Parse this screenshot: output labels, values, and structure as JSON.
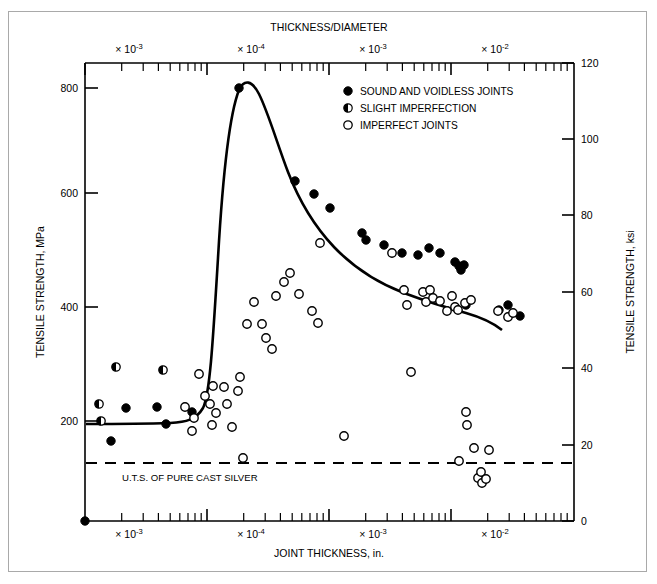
{
  "figure": {
    "background": "#ffffff",
    "frame_color": "#a9a9a9",
    "ink": "#000000"
  },
  "chart_data": {
    "type": "scatter",
    "title": "THICKNESS/DIAMETER",
    "xlabel": "JOINT THICKNESS, in.",
    "ylabel": "TENSILE STRENGTH, MPa",
    "y2label": "TENSILE STRENGTH, ksi",
    "grid": false,
    "legend_position": "top-right",
    "xscale": "log",
    "xlim": [
      1.0,
      10000.0
    ],
    "ylim": [
      0,
      840
    ],
    "y2lim": [
      0,
      120
    ],
    "yticks": [
      200,
      400,
      600,
      800
    ],
    "y2ticks": [
      0,
      20,
      40,
      60,
      80,
      100,
      120
    ],
    "x_decade_labels": [
      "× 10",
      "× 10",
      "× 10",
      "× 10"
    ],
    "x_decade_exponents": [
      "-3",
      "-4",
      "-3",
      "-2"
    ],
    "top_axis_label": "THICKNESS/DIAMETER",
    "bottom_axis_label": "JOINT THICKNESS, in.",
    "annotation_line": {
      "label": "U.T.S. OF PURE CAST SILVER",
      "value_mpa": 110,
      "value_ksi": 16,
      "style": "dashed"
    },
    "legend": [
      {
        "label": "SOUND AND VOIDLESS JOINTS",
        "marker": "filled-circle"
      },
      {
        "label": "SLIGHT IMPERFECTION",
        "marker": "half-filled-circle"
      },
      {
        "label": "IMPERFECT JOINTS",
        "marker": "open-circle"
      }
    ],
    "series": [
      {
        "name": "SOUND AND VOIDLESS JOINTS",
        "marker": "filled-circle",
        "points": [
          {
            "px": 85,
            "py": 521
          },
          {
            "px": 111,
            "py": 441
          },
          {
            "px": 126,
            "py": 408
          },
          {
            "px": 157,
            "py": 407
          },
          {
            "px": 166,
            "py": 424
          },
          {
            "px": 192,
            "py": 412
          },
          {
            "px": 239,
            "py": 88
          },
          {
            "px": 295,
            "py": 181
          },
          {
            "px": 314,
            "py": 194
          },
          {
            "px": 330,
            "py": 208
          },
          {
            "px": 362,
            "py": 233
          },
          {
            "px": 366,
            "py": 240
          },
          {
            "px": 384,
            "py": 245
          },
          {
            "px": 402,
            "py": 253
          },
          {
            "px": 418,
            "py": 255
          },
          {
            "px": 429,
            "py": 248
          },
          {
            "px": 440,
            "py": 253
          },
          {
            "px": 455,
            "py": 262
          },
          {
            "px": 459,
            "py": 266
          },
          {
            "px": 461,
            "py": 270
          },
          {
            "px": 464,
            "py": 265
          },
          {
            "px": 466,
            "py": 305
          },
          {
            "px": 499,
            "py": 310
          },
          {
            "px": 508,
            "py": 305
          },
          {
            "px": 520,
            "py": 316
          }
        ]
      },
      {
        "name": "SLIGHT IMPERFECTION",
        "marker": "half-filled-circle",
        "points": [
          {
            "px": 99,
            "py": 404
          },
          {
            "px": 101,
            "py": 421
          },
          {
            "px": 116,
            "py": 367
          },
          {
            "px": 163,
            "py": 370
          }
        ]
      },
      {
        "name": "IMPERFECT JOINTS",
        "marker": "open-circle",
        "points": [
          {
            "px": 185,
            "py": 407
          },
          {
            "px": 192,
            "py": 431
          },
          {
            "px": 194,
            "py": 418
          },
          {
            "px": 199,
            "py": 374
          },
          {
            "px": 205,
            "py": 396
          },
          {
            "px": 210,
            "py": 404
          },
          {
            "px": 212,
            "py": 425
          },
          {
            "px": 213,
            "py": 386
          },
          {
            "px": 216,
            "py": 413
          },
          {
            "px": 224,
            "py": 387
          },
          {
            "px": 227,
            "py": 404
          },
          {
            "px": 232,
            "py": 427
          },
          {
            "px": 238,
            "py": 391
          },
          {
            "px": 240,
            "py": 377
          },
          {
            "px": 243,
            "py": 458
          },
          {
            "px": 247,
            "py": 324
          },
          {
            "px": 254,
            "py": 302
          },
          {
            "px": 262,
            "py": 324
          },
          {
            "px": 266,
            "py": 338
          },
          {
            "px": 272,
            "py": 349
          },
          {
            "px": 276,
            "py": 296
          },
          {
            "px": 284,
            "py": 282
          },
          {
            "px": 290,
            "py": 273
          },
          {
            "px": 299,
            "py": 294
          },
          {
            "px": 312,
            "py": 311
          },
          {
            "px": 318,
            "py": 323
          },
          {
            "px": 320,
            "py": 243
          },
          {
            "px": 344,
            "py": 436
          },
          {
            "px": 392,
            "py": 253
          },
          {
            "px": 404,
            "py": 290
          },
          {
            "px": 407,
            "py": 305
          },
          {
            "px": 411,
            "py": 372
          },
          {
            "px": 423,
            "py": 292
          },
          {
            "px": 426,
            "py": 302
          },
          {
            "px": 430,
            "py": 290
          },
          {
            "px": 433,
            "py": 298
          },
          {
            "px": 440,
            "py": 301
          },
          {
            "px": 447,
            "py": 311
          },
          {
            "px": 452,
            "py": 296
          },
          {
            "px": 455,
            "py": 307
          },
          {
            "px": 458,
            "py": 310
          },
          {
            "px": 459,
            "py": 461
          },
          {
            "px": 465,
            "py": 303
          },
          {
            "px": 466,
            "py": 412
          },
          {
            "px": 467,
            "py": 425
          },
          {
            "px": 471,
            "py": 300
          },
          {
            "px": 474,
            "py": 448
          },
          {
            "px": 478,
            "py": 478
          },
          {
            "px": 481,
            "py": 472
          },
          {
            "px": 482,
            "py": 483
          },
          {
            "px": 486,
            "py": 479
          },
          {
            "px": 489,
            "py": 450
          },
          {
            "px": 498,
            "py": 311
          },
          {
            "px": 508,
            "py": 317
          },
          {
            "px": 513,
            "py": 313
          }
        ]
      }
    ],
    "fit_curve": "descending curve rising from 180 MPa plateau to 785 MPa peak near 3e-4, then decaying to ~450 MPa"
  },
  "axes": {
    "left": {
      "title": "TENSILE STRENGTH, MPa",
      "ticks": [
        "800",
        "600",
        "400",
        "200"
      ]
    },
    "right": {
      "title": "TENSILE STRENGTH, ksi",
      "ticks": [
        "120",
        "100",
        "80",
        "60",
        "40",
        "20",
        "0"
      ]
    },
    "top": {
      "title": "THICKNESS/DIAMETER",
      "decades": [
        {
          "mantissa": "× 10",
          "exponent": "-3"
        },
        {
          "mantissa": "× 10",
          "exponent": "-4"
        },
        {
          "mantissa": "× 10",
          "exponent": "-3"
        },
        {
          "mantissa": "× 10",
          "exponent": "-2"
        }
      ]
    },
    "bottom": {
      "title": "JOINT THICKNESS, in.",
      "decades": [
        {
          "mantissa": "× 10",
          "exponent": "-3"
        },
        {
          "mantissa": "× 10",
          "exponent": "-4"
        },
        {
          "mantissa": "× 10",
          "exponent": "-3"
        },
        {
          "mantissa": "× 10",
          "exponent": "-2"
        }
      ]
    }
  },
  "legend": {
    "items": [
      {
        "label": "SOUND AND VOIDLESS JOINTS",
        "marker": "filled-circle"
      },
      {
        "label": "SLIGHT IMPERFECTION",
        "marker": "half-filled-circle"
      },
      {
        "label": "IMPERFECT JOINTS",
        "marker": "open-circle"
      }
    ]
  },
  "annotation": {
    "uts_label": "U.T.S. OF PURE CAST SILVER"
  }
}
